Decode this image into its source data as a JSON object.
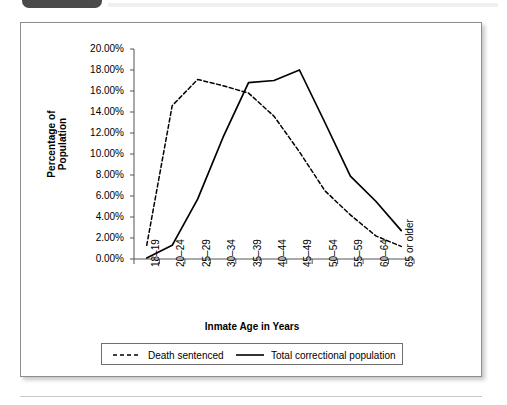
{
  "header": {
    "badge_label": "",
    "badge_color": "#4a4a4a"
  },
  "figure": {
    "border_color": "#8d8d8d"
  },
  "axes": {
    "y_title": "Percentage of Population",
    "x_title": "Inmate Age in Years",
    "y_tick_labels": [
      "20.00%",
      "18.00%",
      "16.00%",
      "14.00%",
      "12.00%",
      "10.00%",
      "8.00%",
      "6.00%",
      "4.00%",
      "2.00%",
      "0.00%"
    ]
  },
  "legend": {
    "entries": [
      {
        "label": "Death sentenced",
        "style": "dashed",
        "color": "#000000"
      },
      {
        "label": "Total correctional population",
        "style": "solid",
        "color": "#000000"
      }
    ]
  },
  "chart_data": {
    "type": "line",
    "title": "",
    "xlabel": "Inmate Age in Years",
    "ylabel": "Percentage of Population",
    "ylim": [
      0,
      20
    ],
    "ytick_values": [
      0,
      2,
      4,
      6,
      8,
      10,
      12,
      14,
      16,
      18,
      20
    ],
    "ytick_format": "percent_2dp",
    "grid": false,
    "legend_position": "bottom",
    "categories": [
      "18–19",
      "20–24",
      "25–29",
      "30–34",
      "35–39",
      "40–44",
      "45–49",
      "50–54",
      "55–59",
      "60–64",
      "65 or older"
    ],
    "series": [
      {
        "name": "Death sentenced",
        "style": "dashed",
        "color": "#000000",
        "values": [
          1.3,
          14.6,
          17.1,
          16.5,
          15.8,
          13.6,
          10.2,
          6.5,
          4.2,
          2.2,
          1.2
        ]
      },
      {
        "name": "Total correctional population",
        "style": "solid",
        "color": "#000000",
        "values": [
          0.1,
          1.3,
          5.7,
          11.6,
          16.8,
          17.0,
          18.0,
          13.0,
          7.9,
          5.5,
          2.7
        ]
      }
    ]
  }
}
